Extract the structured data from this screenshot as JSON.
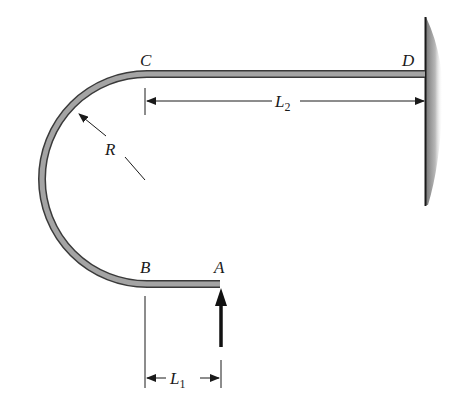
{
  "diagram": {
    "type": "curved cantilever bar with fixed support",
    "points": {
      "A": "A",
      "B": "B",
      "C": "C",
      "D": "D"
    },
    "dimensions": {
      "radius": {
        "symbol": "R"
      },
      "L1": {
        "symbol": "L",
        "subscript": "1"
      },
      "L2": {
        "symbol": "L",
        "subscript": "2"
      }
    },
    "load": {
      "at": "A",
      "direction": "upward"
    },
    "support": {
      "at": "D",
      "type": "fixed wall"
    },
    "colors": {
      "bar_fill": "#9a9a9a",
      "bar_edge": "#3a3a3a",
      "line": "#1a1a1a",
      "wall_shade": "#8a8a8a"
    }
  }
}
